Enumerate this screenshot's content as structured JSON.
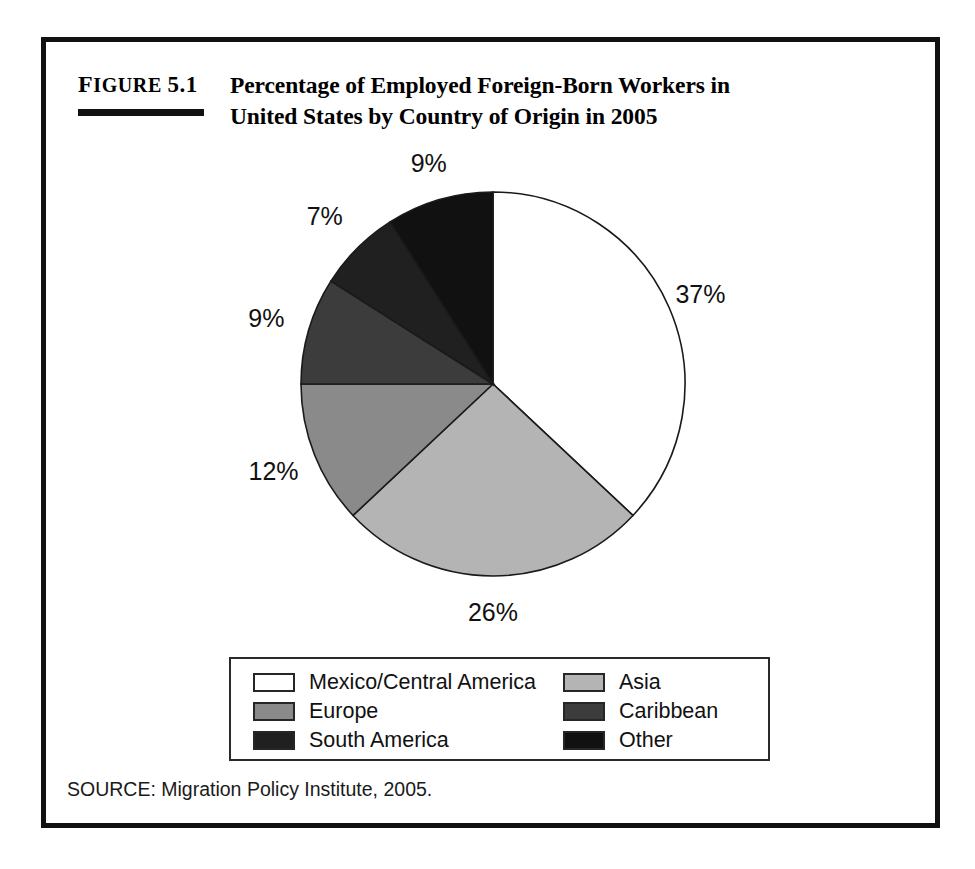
{
  "figure": {
    "label_prefix": "Figure",
    "label_number": "5.1",
    "title_line1": "Percentage of Employed Foreign-Born Workers in",
    "title_line2": "United States by Country of Origin in 2005",
    "source": "SOURCE: Migration Policy Institute, 2005."
  },
  "chart_data": {
    "type": "pie",
    "title": "Percentage of Employed Foreign-Born Workers in United States by Country of Origin in 2005",
    "xlabel": "",
    "ylabel": "",
    "categories": [
      "Mexico/Central America",
      "Asia",
      "Europe",
      "Caribbean",
      "South America",
      "Other"
    ],
    "values": [
      37,
      26,
      12,
      9,
      7,
      9
    ],
    "data_labels": [
      "37%",
      "26%",
      "12%",
      "9%",
      "7%",
      "9%"
    ],
    "colors": [
      "#ffffff",
      "#b4b4b4",
      "#8a8a8a",
      "#3c3c3c",
      "#202020",
      "#111111"
    ],
    "units": "percent",
    "start_angle_deg": 0,
    "direction": "clockwise",
    "legend_position": "bottom",
    "grid": false,
    "slices": [
      {
        "label": "Mexico/Central America",
        "value": 37,
        "data_label": "37%",
        "color": "#ffffff"
      },
      {
        "label": "Asia",
        "value": 26,
        "data_label": "26%",
        "color": "#b4b4b4"
      },
      {
        "label": "Europe",
        "value": 12,
        "data_label": "12%",
        "color": "#8a8a8a"
      },
      {
        "label": "Caribbean",
        "value": 9,
        "data_label": "9%",
        "color": "#3c3c3c"
      },
      {
        "label": "South America",
        "value": 7,
        "data_label": "7%",
        "color": "#202020"
      },
      {
        "label": "Other",
        "value": 9,
        "data_label": "9%",
        "color": "#111111"
      }
    ]
  },
  "legend": {
    "column_left": [
      {
        "label": "Mexico/Central America",
        "color": "#ffffff"
      },
      {
        "label": "Europe",
        "color": "#8a8a8a"
      },
      {
        "label": "South America",
        "color": "#202020"
      }
    ],
    "column_right": [
      {
        "label": "Asia",
        "color": "#b4b4b4"
      },
      {
        "label": "Caribbean",
        "color": "#3c3c3c"
      },
      {
        "label": "Other",
        "color": "#111111"
      }
    ]
  }
}
